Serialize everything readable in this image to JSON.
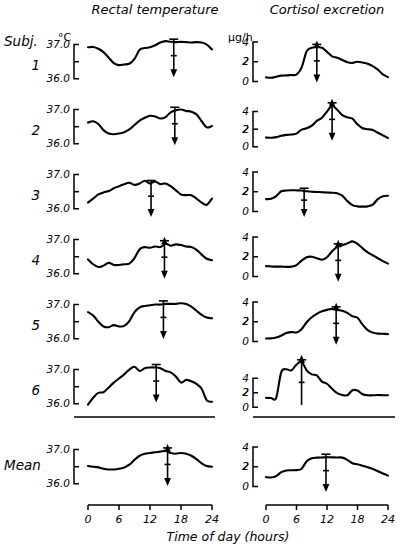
{
  "figure": {
    "column_titles": [
      "Rectal  temperature",
      "Cortisol  excretion"
    ],
    "row_header_label": "Subj.",
    "row_labels": [
      "1",
      "2",
      "3",
      "4",
      "5",
      "6"
    ],
    "mean_label": "Mean",
    "xlabel": "Time of day (hours)",
    "units": {
      "temperature": "°C",
      "cortisol": "μg/h"
    },
    "axis_color": "#000000",
    "curve_color": "#000000",
    "background": "#ffffff"
  },
  "chart_data": {
    "type": "line",
    "xlabel": "Time of day (hours)",
    "x_ticks": [
      0,
      6,
      12,
      18,
      24
    ],
    "xlim": [
      0,
      24
    ],
    "grid": false,
    "legend": "none",
    "panels": [
      {
        "row": "1",
        "variable": "Rectal temperature",
        "ylabel": "°C",
        "y_ticks": [
          36.0,
          37.0
        ],
        "y_tick_labels": [
          "36.0",
          "37.0"
        ],
        "ylim": [
          35.85,
          37.25
        ],
        "acrophase_hour": 16.6,
        "acrophase_direction": "down",
        "x": [
          0,
          1,
          2,
          3,
          4,
          5,
          6,
          7,
          8,
          9,
          10,
          11,
          12,
          13,
          14,
          15,
          16,
          17,
          18,
          19,
          20,
          21,
          22,
          23,
          24
        ],
        "y": [
          36.92,
          36.93,
          36.88,
          36.78,
          36.62,
          36.46,
          36.4,
          36.42,
          36.44,
          36.58,
          36.85,
          36.9,
          36.92,
          36.98,
          37.06,
          37.1,
          37.08,
          37.07,
          37.08,
          37.07,
          37.06,
          37.07,
          37.06,
          37.0,
          36.86
        ]
      },
      {
        "row": "1",
        "variable": "Cortisol excretion",
        "ylabel": "μg/h",
        "y_ticks": [
          0,
          2,
          4
        ],
        "y_tick_labels": [
          "0",
          "2",
          "4"
        ],
        "ylim": [
          -0.25,
          4.6
        ],
        "acrophase_hour": 10.0,
        "acrophase_direction": "both",
        "x": [
          0,
          1,
          2,
          3,
          4,
          5,
          6,
          7,
          8,
          9,
          10,
          11,
          12,
          13,
          14,
          15,
          16,
          17,
          18,
          19,
          20,
          21,
          22,
          23,
          24
        ],
        "y": [
          0.42,
          0.38,
          0.48,
          0.6,
          0.62,
          0.66,
          0.7,
          1.4,
          3.05,
          3.42,
          3.45,
          3.42,
          3.0,
          2.55,
          2.4,
          2.18,
          1.95,
          1.88,
          2.0,
          1.92,
          1.8,
          1.55,
          1.2,
          0.72,
          0.45
        ]
      },
      {
        "row": "2",
        "variable": "Rectal temperature",
        "ylabel": "°C",
        "y_ticks": [
          36.0,
          37.0
        ],
        "y_tick_labels": [
          "36.0",
          "37.0"
        ],
        "ylim": [
          35.85,
          37.25
        ],
        "acrophase_hour": 16.8,
        "acrophase_direction": "down",
        "x": [
          0,
          1,
          2,
          3,
          4,
          5,
          6,
          7,
          8,
          9,
          10,
          11,
          12,
          13,
          14,
          15,
          16,
          17,
          18,
          19,
          20,
          21,
          22,
          23,
          24
        ],
        "y": [
          36.62,
          36.66,
          36.58,
          36.4,
          36.3,
          36.28,
          36.3,
          36.34,
          36.42,
          36.55,
          36.68,
          36.76,
          36.82,
          36.8,
          36.74,
          36.78,
          36.92,
          36.98,
          37.0,
          36.96,
          36.94,
          36.86,
          36.66,
          36.48,
          36.52
        ]
      },
      {
        "row": "2",
        "variable": "Cortisol excretion",
        "ylabel": "μg/h",
        "y_ticks": [
          0,
          2,
          4
        ],
        "y_tick_labels": [
          "0",
          "2",
          "4"
        ],
        "ylim": [
          -0.25,
          5.2
        ],
        "acrophase_hour": 13.0,
        "acrophase_direction": "both",
        "x": [
          0,
          1,
          2,
          3,
          4,
          5,
          6,
          7,
          8,
          9,
          10,
          11,
          12,
          13,
          14,
          15,
          16,
          17,
          18,
          19,
          20,
          21,
          22,
          23,
          24
        ],
        "y": [
          1.05,
          1.02,
          1.1,
          1.25,
          1.35,
          1.4,
          1.5,
          1.95,
          2.1,
          2.4,
          2.95,
          3.3,
          4.0,
          4.65,
          4.2,
          3.6,
          3.35,
          3.2,
          2.55,
          2.1,
          2.0,
          1.9,
          1.6,
          1.3,
          1.0
        ]
      },
      {
        "row": "3",
        "variable": "Rectal temperature",
        "ylabel": "°C",
        "y_ticks": [
          36.0,
          37.0
        ],
        "y_tick_labels": [
          "36.0",
          "37.0"
        ],
        "ylim": [
          35.85,
          37.25
        ],
        "acrophase_hour": 12.2,
        "acrophase_direction": "down",
        "x": [
          0,
          1,
          2,
          3,
          4,
          5,
          6,
          7,
          8,
          9,
          10,
          11,
          12,
          13,
          14,
          15,
          16,
          17,
          18,
          19,
          20,
          21,
          22,
          23,
          24
        ],
        "y": [
          36.18,
          36.3,
          36.42,
          36.48,
          36.52,
          36.6,
          36.66,
          36.72,
          36.76,
          36.7,
          36.74,
          36.82,
          36.74,
          36.8,
          36.72,
          36.74,
          36.66,
          36.54,
          36.42,
          36.4,
          36.4,
          36.3,
          36.18,
          36.12,
          36.3
        ]
      },
      {
        "row": "3",
        "variable": "Cortisol excretion",
        "ylabel": "μg/h",
        "y_ticks": [
          0,
          2,
          4
        ],
        "y_tick_labels": [
          "0",
          "2",
          "4"
        ],
        "ylim": [
          -0.25,
          4.6
        ],
        "acrophase_hour": 7.5,
        "acrophase_direction": "down",
        "x": [
          0,
          1,
          2,
          3,
          4,
          5,
          6,
          7,
          8,
          9,
          10,
          11,
          12,
          13,
          14,
          15,
          16,
          17,
          18,
          19,
          20,
          21,
          22,
          23,
          24
        ],
        "y": [
          1.25,
          1.28,
          1.55,
          2.05,
          2.12,
          2.15,
          2.14,
          2.12,
          2.05,
          2.0,
          1.98,
          1.95,
          1.92,
          1.9,
          1.85,
          1.6,
          1.05,
          0.65,
          0.52,
          0.5,
          0.52,
          0.7,
          1.25,
          1.55,
          1.6
        ]
      },
      {
        "row": "4",
        "variable": "Rectal temperature",
        "ylabel": "°C",
        "y_ticks": [
          36.0,
          37.0
        ],
        "y_tick_labels": [
          "36.0",
          "37.0"
        ],
        "ylim": [
          35.85,
          37.25
        ],
        "acrophase_hour": 14.8,
        "acrophase_direction": "both",
        "x": [
          0,
          1,
          2,
          3,
          4,
          5,
          6,
          7,
          8,
          9,
          10,
          11,
          12,
          13,
          14,
          15,
          16,
          17,
          18,
          19,
          20,
          21,
          22,
          23,
          24
        ],
        "y": [
          36.42,
          36.28,
          36.2,
          36.24,
          36.32,
          36.26,
          36.26,
          36.28,
          36.3,
          36.46,
          36.72,
          36.78,
          36.76,
          36.8,
          36.78,
          36.88,
          36.82,
          36.86,
          36.84,
          36.8,
          36.78,
          36.7,
          36.56,
          36.44,
          36.4
        ]
      },
      {
        "row": "4",
        "variable": "Cortisol excretion",
        "ylabel": "μg/h",
        "y_ticks": [
          0,
          2,
          4
        ],
        "y_tick_labels": [
          "0",
          "2",
          "4"
        ],
        "ylim": [
          -0.25,
          4.6
        ],
        "acrophase_hour": 14.2,
        "acrophase_direction": "both",
        "x": [
          0,
          1,
          2,
          3,
          4,
          5,
          6,
          7,
          8,
          9,
          10,
          11,
          12,
          13,
          14,
          15,
          16,
          17,
          18,
          19,
          20,
          21,
          22,
          23,
          24
        ],
        "y": [
          1.05,
          1.02,
          1.0,
          1.0,
          0.98,
          1.0,
          1.15,
          1.6,
          1.95,
          2.0,
          1.85,
          1.7,
          1.95,
          2.55,
          3.0,
          3.15,
          3.35,
          3.55,
          3.3,
          2.85,
          2.45,
          2.15,
          1.85,
          1.55,
          1.3
        ]
      },
      {
        "row": "5",
        "variable": "Rectal temperature",
        "ylabel": "°C",
        "y_ticks": [
          36.0,
          37.0
        ],
        "y_tick_labels": [
          "36.0",
          "37.0"
        ],
        "ylim": [
          35.85,
          37.25
        ],
        "acrophase_hour": 14.6,
        "acrophase_direction": "down",
        "x": [
          0,
          1,
          2,
          3,
          4,
          5,
          6,
          7,
          8,
          9,
          10,
          11,
          12,
          13,
          14,
          15,
          16,
          17,
          18,
          19,
          20,
          21,
          22,
          23,
          24
        ],
        "y": [
          36.78,
          36.68,
          36.5,
          36.36,
          36.34,
          36.4,
          36.36,
          36.38,
          36.52,
          36.78,
          36.92,
          36.96,
          36.98,
          37.0,
          37.0,
          37.02,
          37.02,
          37.02,
          37.04,
          37.02,
          36.94,
          36.82,
          36.7,
          36.62,
          36.6
        ]
      },
      {
        "row": "5",
        "variable": "Cortisol excretion",
        "ylabel": "μg/h",
        "y_ticks": [
          0,
          2,
          4
        ],
        "y_tick_labels": [
          "0",
          "2",
          "4"
        ],
        "ylim": [
          -0.25,
          4.6
        ],
        "acrophase_hour": 13.8,
        "acrophase_direction": "both",
        "x": [
          0,
          1,
          2,
          3,
          4,
          5,
          6,
          7,
          8,
          9,
          10,
          11,
          12,
          13,
          14,
          15,
          16,
          17,
          18,
          19,
          20,
          21,
          22,
          23,
          24
        ],
        "y": [
          0.3,
          0.32,
          0.4,
          0.6,
          0.85,
          0.95,
          0.92,
          1.25,
          1.95,
          2.45,
          2.8,
          3.05,
          3.2,
          3.3,
          3.2,
          3.1,
          2.9,
          2.55,
          2.4,
          1.7,
          1.15,
          0.9,
          0.8,
          0.78,
          0.75
        ]
      },
      {
        "row": "6",
        "variable": "Rectal temperature",
        "ylabel": "°C",
        "y_ticks": [
          36.0,
          37.0
        ],
        "y_tick_labels": [
          "36.0",
          "37.0"
        ],
        "ylim": [
          35.85,
          37.25
        ],
        "acrophase_hour": 13.2,
        "acrophase_direction": "down",
        "x": [
          0,
          1,
          2,
          3,
          4,
          5,
          6,
          7,
          8,
          9,
          10,
          11,
          12,
          13,
          14,
          15,
          16,
          17,
          18,
          19,
          20,
          21,
          22,
          23,
          24
        ],
        "y": [
          35.98,
          36.18,
          36.32,
          36.34,
          36.48,
          36.62,
          36.74,
          36.86,
          37.0,
          37.08,
          36.96,
          37.04,
          37.06,
          37.06,
          37.04,
          36.96,
          36.92,
          36.8,
          36.62,
          36.7,
          36.66,
          36.58,
          36.44,
          36.1,
          36.06
        ]
      },
      {
        "row": "6",
        "variable": "Cortisol excretion",
        "ylabel": "μg/h",
        "y_ticks": [
          0,
          2,
          4
        ],
        "y_tick_labels": [
          "0",
          "2",
          "4"
        ],
        "ylim": [
          -0.25,
          6.4
        ],
        "acrophase_hour": 7.0,
        "acrophase_direction": "up",
        "x": [
          0,
          1,
          2,
          3,
          4,
          5,
          6,
          7,
          8,
          9,
          10,
          11,
          12,
          13,
          14,
          15,
          16,
          17,
          18,
          19,
          20,
          21,
          22,
          23,
          24
        ],
        "y": [
          1.3,
          1.28,
          1.3,
          4.85,
          5.25,
          5.1,
          5.9,
          6.3,
          5.1,
          4.55,
          4.4,
          3.55,
          3.25,
          2.55,
          1.95,
          1.7,
          1.65,
          2.35,
          2.3,
          1.8,
          1.65,
          1.65,
          1.68,
          1.66,
          1.65
        ]
      },
      {
        "row": "Mean",
        "variable": "Rectal temperature",
        "ylabel": "°C",
        "y_ticks": [
          36.0,
          37.0
        ],
        "y_tick_labels": [
          "36.0",
          "37.0"
        ],
        "ylim": [
          35.85,
          37.25
        ],
        "acrophase_hour": 15.4,
        "acrophase_direction": "both",
        "x": [
          0,
          1,
          2,
          3,
          4,
          5,
          6,
          7,
          8,
          9,
          10,
          11,
          12,
          13,
          14,
          15,
          16,
          17,
          18,
          19,
          20,
          21,
          22,
          23,
          24
        ],
        "y": [
          36.52,
          36.5,
          36.48,
          36.44,
          36.42,
          36.42,
          36.44,
          36.48,
          36.56,
          36.7,
          36.82,
          36.88,
          36.9,
          36.92,
          36.94,
          36.96,
          36.9,
          36.88,
          36.9,
          36.88,
          36.82,
          36.72,
          36.6,
          36.52,
          36.5
        ]
      },
      {
        "row": "Mean",
        "variable": "Cortisol excretion",
        "ylabel": "μg/h",
        "y_ticks": [
          0,
          2,
          4
        ],
        "y_tick_labels": [
          "0",
          "2",
          "4"
        ],
        "ylim": [
          -0.25,
          4.6
        ],
        "acrophase_hour": 11.8,
        "acrophase_direction": "down",
        "x": [
          0,
          1,
          2,
          3,
          4,
          5,
          6,
          7,
          8,
          9,
          10,
          11,
          12,
          13,
          14,
          15,
          16,
          17,
          18,
          19,
          20,
          21,
          22,
          23,
          24
        ],
        "y": [
          0.95,
          0.92,
          1.05,
          1.45,
          1.62,
          1.64,
          1.66,
          1.8,
          2.55,
          2.85,
          2.92,
          2.94,
          2.96,
          2.95,
          2.94,
          2.92,
          2.7,
          2.35,
          2.25,
          2.1,
          1.95,
          1.78,
          1.55,
          1.32,
          1.1
        ]
      }
    ]
  }
}
